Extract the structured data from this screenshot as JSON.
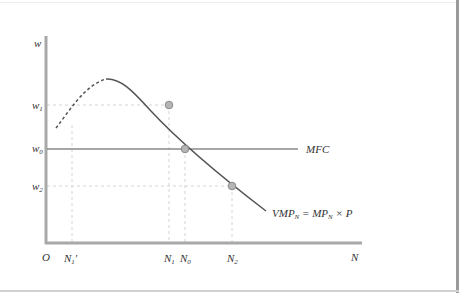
{
  "figure": {
    "y_axis_label": "w",
    "x_axis_label": "N",
    "origin_label": "O",
    "y_ticks": [
      {
        "key": "w1",
        "base": "w",
        "sub": "1",
        "y": 105
      },
      {
        "key": "w0",
        "base": "w",
        "sub": "0",
        "y": 149
      },
      {
        "key": "w2",
        "base": "w",
        "sub": "2",
        "y": 186
      }
    ],
    "x_ticks": [
      {
        "key": "N1prime",
        "base": "N",
        "sub": "1",
        "prime": "′",
        "x": 72
      },
      {
        "key": "N1",
        "base": "N",
        "sub": "1",
        "x": 169
      },
      {
        "key": "N0",
        "base": "N",
        "sub": "0",
        "x": 185
      },
      {
        "key": "N2",
        "base": "N",
        "sub": "2",
        "x": 232
      }
    ],
    "curves": {
      "mfc": {
        "label": "MFC",
        "level": "w0"
      },
      "vmp": {
        "label_parts": [
          "VMP",
          "N",
          " = MP",
          "N",
          " × P"
        ],
        "label_full": "VMP_N = MP_N × P",
        "dashed_segment": "rising portion up to peak",
        "solid_segment": "falling portion after peak"
      }
    },
    "points": [
      {
        "at": "N1,w1",
        "x": 169,
        "y": 105
      },
      {
        "at": "N0,w0",
        "x": 185,
        "y": 149
      },
      {
        "at": "N2,w2",
        "x": 232,
        "y": 186
      }
    ],
    "colors": {
      "axis": "#a8a8a8",
      "curve": "#555555",
      "mfc_line": "#8a8a8a",
      "guides": "#d4d4d4",
      "point_fill": "#b5b5b5",
      "point_stroke": "#8a8a8a",
      "text": "#333333"
    }
  }
}
